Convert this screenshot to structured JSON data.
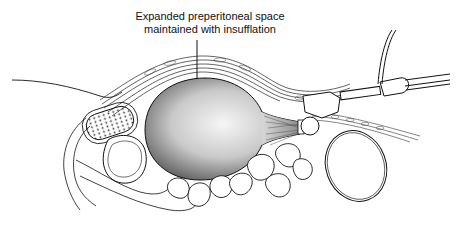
{
  "figure": {
    "type": "medical-illustration",
    "annotation": {
      "line1": "Expanded preperitoneal space",
      "line2": "maintained with insufflation"
    },
    "colors": {
      "ink": "#111111",
      "background": "#ffffff",
      "balloon_light": "#f4f4f4",
      "balloon_dark": "#6a6a6a"
    }
  }
}
